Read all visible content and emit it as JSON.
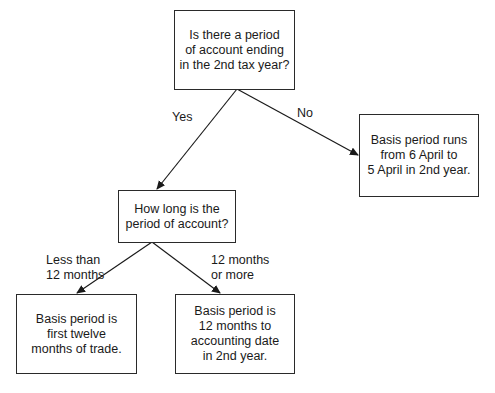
{
  "nodes": {
    "q1": {
      "text": "Is there a period\nof account ending\nin the 2nd tax year?"
    },
    "no_result": {
      "text": "Basis period runs\nfrom 6 April to\n5 April in 2nd year."
    },
    "q2": {
      "text": "How long is the\nperiod of account?"
    },
    "less_result": {
      "text": "Basis period is\nfirst twelve\nmonths of trade."
    },
    "more_result": {
      "text": "Basis period is\n12 months to\naccounting date\nin 2nd year."
    }
  },
  "edges": {
    "yes": {
      "label": "Yes"
    },
    "no": {
      "label": "No"
    },
    "less": {
      "label": "Less than\n12 months"
    },
    "more": {
      "label": "12 months\nor more"
    }
  }
}
